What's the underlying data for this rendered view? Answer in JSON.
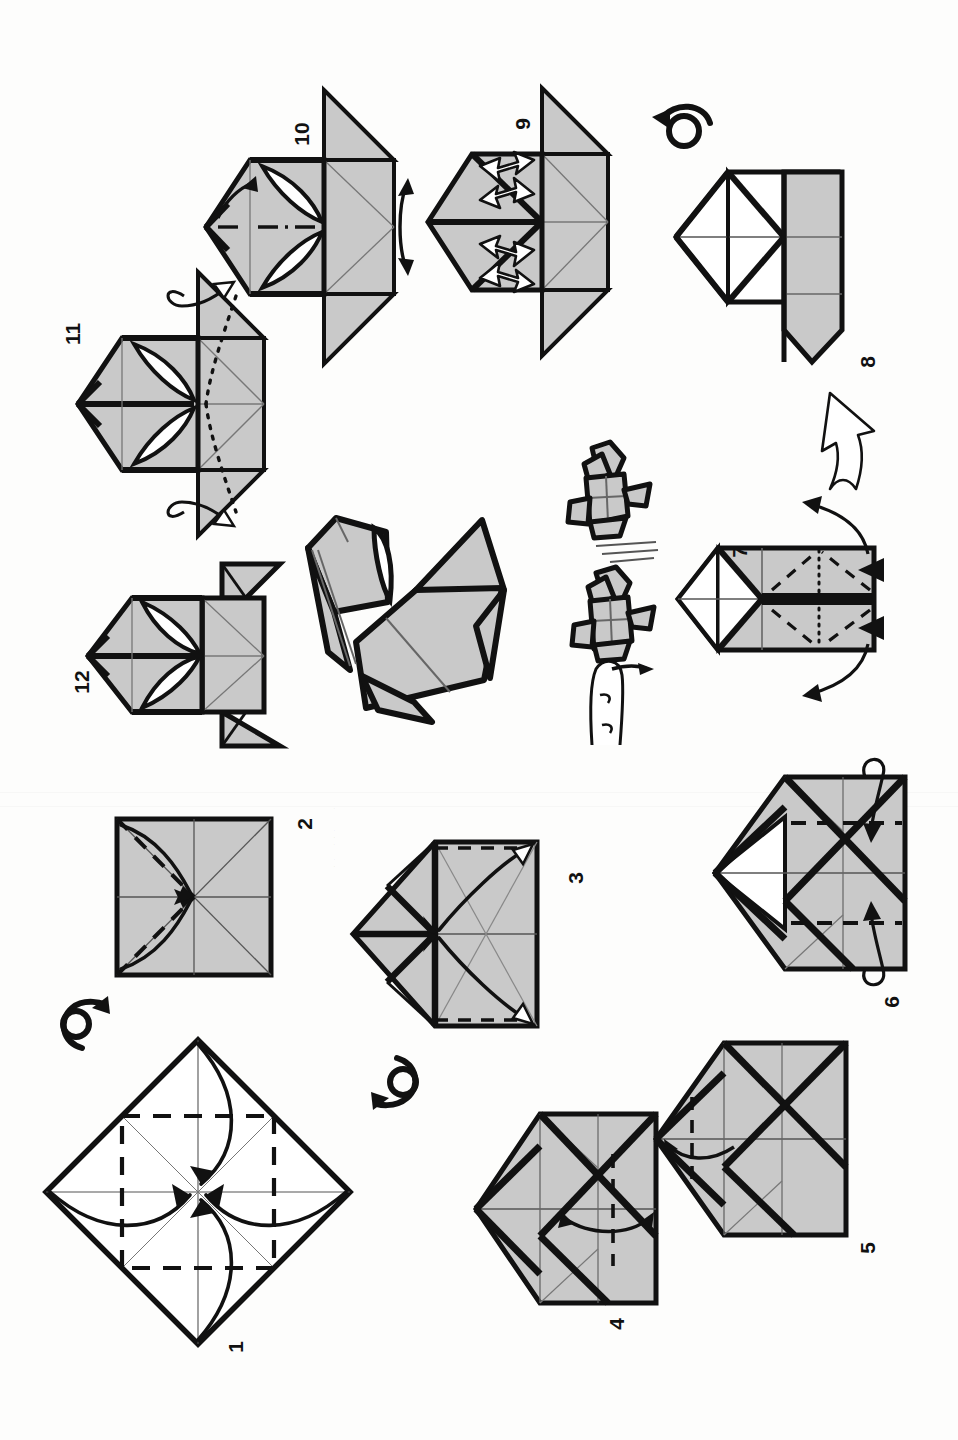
{
  "document": {
    "kind": "origami-instruction-diagram",
    "subject": "jumping frog",
    "orientation": "page rotated 90 degrees counter-clockwise",
    "paper_color": "#fdfdfc",
    "fold_fill": "#c9c9c9",
    "line_color": "#111111",
    "total_steps": 12
  },
  "steps": [
    {
      "number": "1",
      "caption_position": "bottom-left-of-figure"
    },
    {
      "number": "2",
      "caption_position": "right-of-figure"
    },
    {
      "number": "3",
      "caption_position": "right-of-figure"
    },
    {
      "number": "4",
      "caption_position": "bottom-right-of-figure"
    },
    {
      "number": "5",
      "caption_position": "right-of-figure"
    },
    {
      "number": "6",
      "caption_position": "bottom-right-of-figure"
    },
    {
      "number": "7",
      "caption_position": "top-left-of-figure"
    },
    {
      "number": "8",
      "caption_position": "right-of-figure"
    },
    {
      "number": "9",
      "caption_position": "top-left-of-figure"
    },
    {
      "number": "10",
      "caption_position": "top-left-of-figure"
    },
    {
      "number": "11",
      "caption_position": "top-left-of-figure"
    },
    {
      "number": "12",
      "caption_position": "bottom-left-of-figure"
    }
  ],
  "symbols": {
    "turn_over_1": "turn-over-arrow",
    "turn_over_2": "turn-over-arrow",
    "turn_over_3": "turn-over-arrow",
    "open_arrow": "hollow-open-out-arrow",
    "push_markers": "solid-black-triangle-push",
    "repeat_arrows": "white-outlined-zigzag-arrows",
    "motion_lines": "jump-motion-lines",
    "finger": "pressing-finger"
  },
  "final_model": {
    "label": "",
    "views": [
      "large-three-quarter-view",
      "jumping-airborne-view",
      "finger-press-view"
    ]
  }
}
